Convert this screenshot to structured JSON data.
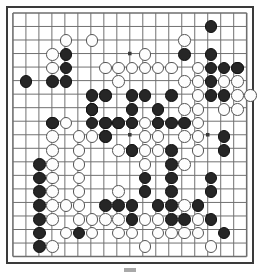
{
  "app": {
    "title": "Go Board",
    "board_size": 19,
    "grid_color": "#6e6e6e",
    "edge_color": "#3a3a3a",
    "black_color": "#262626",
    "white_color": "#fdfdfd",
    "background_color": "#ffffff",
    "stone_diameter": 12.6
  },
  "geometry": {
    "origin_x": 5,
    "origin_y": 5,
    "spacing_x": 13.2,
    "spacing_y": 13.75,
    "star_points": [
      [
        3,
        3
      ],
      [
        9,
        3
      ],
      [
        15,
        3
      ],
      [
        3,
        9
      ],
      [
        9,
        9
      ],
      [
        15,
        9
      ],
      [
        3,
        15
      ],
      [
        9,
        15
      ],
      [
        15,
        15
      ]
    ]
  },
  "chart_data": {
    "type": "table",
    "xlabel": "column (0-18, left to right)",
    "ylabel": "row (0-18, top to bottom)",
    "legend": [
      "black stone",
      "white stone"
    ],
    "black_stones": [
      [
        15,
        1
      ],
      [
        4,
        3
      ],
      [
        13,
        3
      ],
      [
        15,
        3
      ],
      [
        4,
        4
      ],
      [
        15,
        4
      ],
      [
        16,
        4
      ],
      [
        17,
        4
      ],
      [
        1,
        5
      ],
      [
        3,
        5
      ],
      [
        4,
        5
      ],
      [
        15,
        5
      ],
      [
        6,
        6
      ],
      [
        7,
        6
      ],
      [
        9,
        6
      ],
      [
        10,
        6
      ],
      [
        12,
        6
      ],
      [
        15,
        6
      ],
      [
        16,
        6
      ],
      [
        6,
        7
      ],
      [
        9,
        7
      ],
      [
        11,
        7
      ],
      [
        3,
        8
      ],
      [
        6,
        7
      ],
      [
        6,
        8
      ],
      [
        7,
        8
      ],
      [
        8,
        8
      ],
      [
        9,
        8
      ],
      [
        11,
        8
      ],
      [
        12,
        8
      ],
      [
        13,
        8
      ],
      [
        7,
        9
      ],
      [
        16,
        9
      ],
      [
        9,
        10
      ],
      [
        12,
        10
      ],
      [
        16,
        10
      ],
      [
        12,
        11
      ],
      [
        2,
        11
      ],
      [
        2,
        12
      ],
      [
        2,
        13
      ],
      [
        2,
        14
      ],
      [
        2,
        15
      ],
      [
        2,
        16
      ],
      [
        2,
        17
      ],
      [
        10,
        12
      ],
      [
        12,
        12
      ],
      [
        15,
        12
      ],
      [
        10,
        13
      ],
      [
        12,
        13
      ],
      [
        15,
        13
      ],
      [
        7,
        14
      ],
      [
        8,
        14
      ],
      [
        9,
        14
      ],
      [
        11,
        14
      ],
      [
        12,
        14
      ],
      [
        14,
        14
      ],
      [
        9,
        15
      ],
      [
        12,
        15
      ],
      [
        13,
        15
      ],
      [
        15,
        15
      ],
      [
        5,
        16
      ],
      [
        16,
        16
      ]
    ],
    "white_stones": [
      [
        4,
        2
      ],
      [
        6,
        2
      ],
      [
        13,
        2
      ],
      [
        3,
        3
      ],
      [
        10,
        3
      ],
      [
        3,
        4
      ],
      [
        7,
        4
      ],
      [
        8,
        4
      ],
      [
        9,
        4
      ],
      [
        10,
        4
      ],
      [
        11,
        4
      ],
      [
        12,
        4
      ],
      [
        14,
        4
      ],
      [
        17,
        4
      ],
      [
        8,
        5
      ],
      [
        13,
        5
      ],
      [
        14,
        5
      ],
      [
        16,
        5
      ],
      [
        17,
        5
      ],
      [
        7,
        6
      ],
      [
        14,
        6
      ],
      [
        17,
        6
      ],
      [
        18,
        6
      ],
      [
        13,
        7
      ],
      [
        14,
        7
      ],
      [
        16,
        7
      ],
      [
        17,
        7
      ],
      [
        3,
        8
      ],
      [
        4,
        8
      ],
      [
        7,
        8
      ],
      [
        8,
        8
      ],
      [
        9,
        8
      ],
      [
        10,
        8
      ],
      [
        11,
        8
      ],
      [
        14,
        8
      ],
      [
        3,
        9
      ],
      [
        5,
        9
      ],
      [
        6,
        9
      ],
      [
        7,
        9
      ],
      [
        10,
        9
      ],
      [
        11,
        9
      ],
      [
        13,
        9
      ],
      [
        14,
        9
      ],
      [
        3,
        10
      ],
      [
        5,
        10
      ],
      [
        8,
        10
      ],
      [
        9,
        10
      ],
      [
        10,
        10
      ],
      [
        11,
        10
      ],
      [
        14,
        10
      ],
      [
        3,
        11
      ],
      [
        5,
        11
      ],
      [
        10,
        11
      ],
      [
        13,
        11
      ],
      [
        3,
        12
      ],
      [
        5,
        12
      ],
      [
        3,
        13
      ],
      [
        5,
        13
      ],
      [
        8,
        13
      ],
      [
        3,
        14
      ],
      [
        4,
        14
      ],
      [
        5,
        14
      ],
      [
        13,
        14
      ],
      [
        3,
        15
      ],
      [
        5,
        15
      ],
      [
        6,
        15
      ],
      [
        7,
        15
      ],
      [
        8,
        15
      ],
      [
        10,
        15
      ],
      [
        11,
        15
      ],
      [
        14,
        15
      ],
      [
        4,
        16
      ],
      [
        6,
        16
      ],
      [
        8,
        16
      ],
      [
        9,
        16
      ],
      [
        11,
        16
      ],
      [
        12,
        16
      ],
      [
        13,
        16
      ],
      [
        14,
        16
      ],
      [
        3,
        17
      ],
      [
        10,
        17
      ],
      [
        15,
        17
      ]
    ]
  },
  "footer": {
    "mark_label": "progress-mark"
  }
}
